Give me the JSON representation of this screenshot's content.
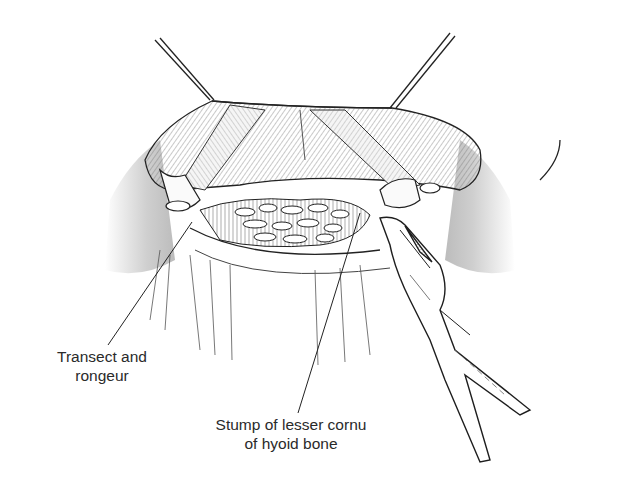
{
  "figure": {
    "colors": {
      "line": "#1e1e1e",
      "hatch": "#6a6a6a",
      "shade": "#bdbdbd",
      "background": "#ffffff"
    }
  },
  "labels": {
    "transect": {
      "line1": "Transect and",
      "line2": "rongeur"
    },
    "stump": {
      "line1": "Stump of lesser cornu",
      "line2": "of hyoid bone"
    }
  }
}
